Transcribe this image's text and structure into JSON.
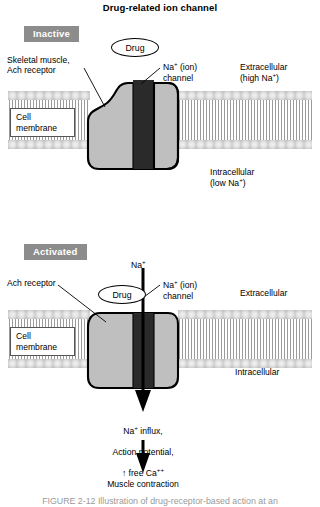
{
  "figure": {
    "title": "Drug-related ion channel",
    "caption": "FIGURE 2-12  Illustration of drug-receptor-based action at an"
  },
  "panels": [
    {
      "badge": "Inactive",
      "labels": {
        "receptor": "Skeletal muscle,\nAch receptor",
        "drug": "Drug",
        "channel": "Na+ (ion)\nchannel",
        "outside": "Extracellular\n(high Na+)",
        "inside": "Intracellular\n(low Na+)",
        "membrane_box": "Cell\nmembrane"
      }
    },
    {
      "badge": "Activated",
      "labels": {
        "receptor": "Ach receptor",
        "drug": "Drug",
        "ion": "Na+",
        "channel": "Na+ (ion)\nchannel",
        "outside": "Extracellular",
        "inside": "Intracellular",
        "membrane_box": "Cell\nmembrane"
      }
    }
  ],
  "outcome": {
    "effects_line1": "Na+ influx,",
    "effects_line2": "Action potential,",
    "effects_line3": "free Ca++",
    "effects_arrow_up": "↑",
    "result": "Muscle contraction"
  },
  "colors": {
    "badge_bg": "#8c8c8c",
    "badge_text": "#ffffff",
    "receptor_fill": "#bfbfbf",
    "channel_closed": "#2a2a2a",
    "channel_open": "#2a2a2a",
    "membrane_head": "#d8d8d8",
    "membrane_tail": "#9a9a9a",
    "outline": "#000000",
    "caption_text": "#9a9a9a"
  }
}
